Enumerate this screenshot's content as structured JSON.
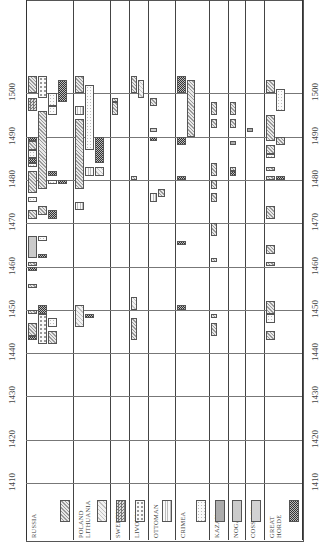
{
  "chart_data": {
    "type": "gantt",
    "orientation": "rotated-90-ccw (time axis vertical, bottom=1410, top=1510)",
    "title": "",
    "xlabel": "Year",
    "ylabel": "",
    "xlim": [
      1410,
      1510
    ],
    "x_ticks": [
      1410,
      1420,
      1430,
      1440,
      1450,
      1460,
      1470,
      1480,
      1490,
      1500
    ],
    "grid": true,
    "legend_position": "bottom (rotated labels with pattern swatches)",
    "categories": [
      "RUSSIA",
      "POLAND LITHUANIA",
      "SWEDEN",
      "LIVONIA",
      "OTTOMAN",
      "CRIMEA",
      "KAZAN",
      "NOGAI",
      "COSSACK",
      "GREAT HORDE"
    ],
    "patterns": {
      "RUSSIA": "diagonal-hatch",
      "POLAND LITHUANIA": "light-diagonal-hatch",
      "SWEDEN": "checkered",
      "LIVONIA": "dotted-open",
      "OTTOMAN": "vertical-lines",
      "CRIMEA": "fine-dots",
      "KAZAN": "dense-dots",
      "NOGAI": "light-dots",
      "COSSACK": "solid-gray",
      "GREAT HORDE": "dark-mottled"
    },
    "series": [
      {
        "column": "RUSSIA",
        "bars": [
          {
            "start": 1444,
            "end": 1447,
            "pattern": "RUSSIA"
          },
          {
            "start": 1449,
            "end": 1450,
            "pattern": "RUSSIA"
          },
          {
            "start": 1455,
            "end": 1456,
            "pattern": "RUSSIA"
          },
          {
            "start": 1460,
            "end": 1461,
            "pattern": "RUSSIA"
          },
          {
            "start": 1471,
            "end": 1473,
            "pattern": "RUSSIA"
          },
          {
            "start": 1477,
            "end": 1482,
            "pattern": "RUSSIA"
          },
          {
            "start": 1487,
            "end": 1489,
            "pattern": "RUSSIA"
          },
          {
            "start": 1478,
            "end": 1496,
            "pattern": "RUSSIA"
          },
          {
            "start": 1500,
            "end": 1504,
            "pattern": "RUSSIA"
          },
          {
            "start": 1496,
            "end": 1499,
            "pattern": "SWEDEN"
          },
          {
            "start": 1499,
            "end": 1504,
            "pattern": "LIVONIA"
          },
          {
            "start": 1442,
            "end": 1449,
            "pattern": "LIVONIA"
          },
          {
            "start": 1446,
            "end": 1448,
            "pattern": "CRIMEA"
          },
          {
            "start": 1442,
            "end": 1445,
            "pattern": "RUSSIA"
          },
          {
            "start": 1472,
            "end": 1474,
            "pattern": "RUSSIA"
          },
          {
            "start": 1462,
            "end": 1467,
            "pattern": "NOGAI"
          },
          {
            "start": 1466,
            "end": 1467,
            "pattern": "CRIMEA"
          },
          {
            "start": 1475,
            "end": 1476,
            "pattern": "CRIMEA"
          },
          {
            "start": 1479,
            "end": 1480,
            "pattern": "CRIMEA"
          },
          {
            "start": 1483,
            "end": 1484,
            "pattern": "CRIMEA"
          },
          {
            "start": 1485,
            "end": 1487,
            "pattern": "CRIMEA"
          },
          {
            "start": 1495,
            "end": 1497,
            "pattern": "CRIMEA"
          },
          {
            "start": 1497,
            "end": 1500,
            "pattern": "CRIMEA"
          },
          {
            "start": 1498,
            "end": 1503,
            "pattern": "GREAT HORDE"
          },
          {
            "start": 1489,
            "end": 1490,
            "pattern": "GREAT HORDE"
          },
          {
            "start": 1484,
            "end": 1485,
            "pattern": "GREAT HORDE"
          },
          {
            "start": 1481,
            "end": 1482,
            "pattern": "GREAT HORDE"
          },
          {
            "start": 1479,
            "end": 1480,
            "pattern": "GREAT HORDE"
          },
          {
            "start": 1471,
            "end": 1473,
            "pattern": "GREAT HORDE"
          },
          {
            "start": 1462,
            "end": 1463,
            "pattern": "GREAT HORDE"
          },
          {
            "start": 1459,
            "end": 1460,
            "pattern": "GREAT HORDE"
          },
          {
            "start": 1449,
            "end": 1451,
            "pattern": "GREAT HORDE"
          },
          {
            "start": 1443,
            "end": 1444,
            "pattern": "GREAT HORDE"
          }
        ]
      },
      {
        "column": "POLAND LITHUANIA",
        "bars": [
          {
            "start": 1478,
            "end": 1494,
            "pattern": "RUSSIA"
          },
          {
            "start": 1500,
            "end": 1504,
            "pattern": "RUSSIA"
          },
          {
            "start": 1487,
            "end": 1502,
            "pattern": "CRIMEA"
          },
          {
            "start": 1481,
            "end": 1483,
            "pattern": "OTTOMAN"
          },
          {
            "start": 1495,
            "end": 1497,
            "pattern": "OTTOMAN"
          },
          {
            "start": 1473,
            "end": 1475,
            "pattern": "OTTOMAN"
          },
          {
            "start": 1446,
            "end": 1451,
            "pattern": "POLAND LITHUANIA"
          },
          {
            "start": 1481,
            "end": 1483,
            "pattern": "POLAND LITHUANIA"
          },
          {
            "start": 1484,
            "end": 1490,
            "pattern": "GREAT HORDE"
          },
          {
            "start": 1448,
            "end": 1449,
            "pattern": "GREAT HORDE"
          }
        ]
      },
      {
        "column": "SWEDEN",
        "bars": [
          {
            "start": 1495,
            "end": 1498,
            "pattern": "RUSSIA"
          },
          {
            "start": 1498,
            "end": 1499,
            "pattern": "RUSSIA"
          }
        ]
      },
      {
        "column": "LIVONIA",
        "bars": [
          {
            "start": 1500,
            "end": 1504,
            "pattern": "RUSSIA"
          },
          {
            "start": 1499,
            "end": 1503,
            "pattern": "POLAND LITHUANIA"
          },
          {
            "start": 1480,
            "end": 1481,
            "pattern": "RUSSIA"
          },
          {
            "start": 1450,
            "end": 1453,
            "pattern": "POLAND LITHUANIA"
          },
          {
            "start": 1443,
            "end": 1448,
            "pattern": "RUSSIA"
          }
        ]
      },
      {
        "column": "OTTOMAN",
        "bars": [
          {
            "start": 1491,
            "end": 1492,
            "pattern": "COSSACK"
          },
          {
            "start": 1489,
            "end": 1490,
            "pattern": "GREAT HORDE"
          },
          {
            "start": 1475,
            "end": 1477,
            "pattern": "OTTOMAN"
          },
          {
            "start": 1476,
            "end": 1478,
            "pattern": "RUSSIA"
          },
          {
            "start": 1497,
            "end": 1499,
            "pattern": "RUSSIA"
          }
        ]
      },
      {
        "column": "CRIMEA",
        "bars": [
          {
            "start": 1500,
            "end": 1504,
            "pattern": "GREAT HORDE"
          },
          {
            "start": 1490,
            "end": 1503,
            "pattern": "RUSSIA"
          },
          {
            "start": 1488,
            "end": 1490,
            "pattern": "GREAT HORDE"
          },
          {
            "start": 1480,
            "end": 1481,
            "pattern": "GREAT HORDE"
          },
          {
            "start": 1465,
            "end": 1466,
            "pattern": "GREAT HORDE"
          },
          {
            "start": 1450,
            "end": 1451,
            "pattern": "GREAT HORDE"
          }
        ]
      },
      {
        "column": "KAZAN",
        "bars": [
          {
            "start": 1495,
            "end": 1498,
            "pattern": "RUSSIA"
          },
          {
            "start": 1492,
            "end": 1494,
            "pattern": "RUSSIA"
          },
          {
            "start": 1481,
            "end": 1484,
            "pattern": "RUSSIA"
          },
          {
            "start": 1478,
            "end": 1480,
            "pattern": "RUSSIA"
          },
          {
            "start": 1475,
            "end": 1477,
            "pattern": "RUSSIA"
          },
          {
            "start": 1467,
            "end": 1470,
            "pattern": "RUSSIA"
          },
          {
            "start": 1461,
            "end": 1462,
            "pattern": "RUSSIA"
          },
          {
            "start": 1448,
            "end": 1449,
            "pattern": "RUSSIA"
          },
          {
            "start": 1444,
            "end": 1447,
            "pattern": "RUSSIA"
          }
        ]
      },
      {
        "column": "NOGAI",
        "bars": [
          {
            "start": 1495,
            "end": 1498,
            "pattern": "RUSSIA"
          },
          {
            "start": 1492,
            "end": 1494,
            "pattern": "RUSSIA"
          },
          {
            "start": 1482,
            "end": 1483,
            "pattern": "RUSSIA"
          },
          {
            "start": 1488,
            "end": 1489,
            "pattern": "KAZAN"
          },
          {
            "start": 1481,
            "end": 1482,
            "pattern": "GREAT HORDE"
          }
        ]
      },
      {
        "column": "COSSACK",
        "bars": [
          {
            "start": 1491,
            "end": 1492,
            "pattern": "KAZAN"
          }
        ]
      },
      {
        "column": "GREAT HORDE",
        "bars": [
          {
            "start": 1500,
            "end": 1503,
            "pattern": "RUSSIA"
          },
          {
            "start": 1496,
            "end": 1501,
            "pattern": "CRIMEA"
          },
          {
            "start": 1489,
            "end": 1495,
            "pattern": "RUSSIA"
          },
          {
            "start": 1488,
            "end": 1490,
            "pattern": "RUSSIA"
          },
          {
            "start": 1486,
            "end": 1488,
            "pattern": "RUSSIA"
          },
          {
            "start": 1485,
            "end": 1486,
            "pattern": "CRIMEA"
          },
          {
            "start": 1482,
            "end": 1483,
            "pattern": "RUSSIA"
          },
          {
            "start": 1480,
            "end": 1481,
            "pattern": "RUSSIA"
          },
          {
            "start": 1480,
            "end": 1481,
            "pattern": "GREAT HORDE"
          },
          {
            "start": 1471,
            "end": 1474,
            "pattern": "RUSSIA"
          },
          {
            "start": 1463,
            "end": 1465,
            "pattern": "RUSSIA"
          },
          {
            "start": 1460,
            "end": 1461,
            "pattern": "RUSSIA"
          },
          {
            "start": 1449,
            "end": 1452,
            "pattern": "RUSSIA"
          },
          {
            "start": 1447,
            "end": 1449,
            "pattern": "CRIMEA"
          },
          {
            "start": 1443,
            "end": 1445,
            "pattern": "RUSSIA"
          }
        ]
      }
    ]
  },
  "axis": {
    "left_ticks": [
      "1410",
      "1420",
      "1430",
      "1440",
      "1450",
      "1460",
      "1470",
      "1480",
      "1490",
      "1500"
    ],
    "right_ticks": [
      "1410",
      "1420",
      "1430",
      "1440",
      "1450",
      "1460",
      "1470",
      "1480",
      "1490",
      "1500"
    ]
  },
  "legend": [
    {
      "label": "RUSSIA",
      "pattern": "p-russia"
    },
    {
      "label": "POLAND LITHUANIA",
      "pattern": "p-poland"
    },
    {
      "label": "SWEDEN",
      "pattern": "p-sweden"
    },
    {
      "label": "LIVONIA",
      "pattern": "p-livonia"
    },
    {
      "label": "OTTOMAN",
      "pattern": "p-ottoman"
    },
    {
      "label": "CRIMEA",
      "pattern": "p-crimea"
    },
    {
      "label": "KAZAN",
      "pattern": "p-kazan"
    },
    {
      "label": "NOGAI",
      "pattern": "p-nogai"
    },
    {
      "label": "COSSACK",
      "pattern": "p-cossack"
    },
    {
      "label": "GREAT HORDE",
      "pattern": "p-horde"
    }
  ]
}
